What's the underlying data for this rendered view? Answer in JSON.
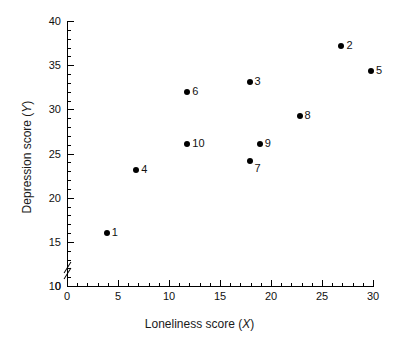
{
  "chart_data": {
    "type": "scatter",
    "title": "",
    "xlabel": "Loneliness score (X)",
    "ylabel": "Depression score (Y)",
    "xlabel_text": "Loneliness score (",
    "xlabel_var": "X",
    "xlabel_tail": ")",
    "ylabel_text": "Depression score (",
    "ylabel_var": "Y",
    "ylabel_tail": ")",
    "xlim": [
      0,
      30
    ],
    "ylim": [
      10,
      40
    ],
    "y_axis_break": true,
    "y_break_label": "0",
    "grid": false,
    "legend": "none",
    "x_major_ticks": [
      0,
      5,
      10,
      15,
      20,
      25,
      30
    ],
    "x_tick_labels": [
      "0",
      "5",
      "10",
      "15",
      "20",
      "25",
      "30"
    ],
    "x_minor_step": 1,
    "y_major_ticks": [
      10,
      15,
      20,
      25,
      30,
      35,
      40
    ],
    "y_tick_labels": [
      "10",
      "15",
      "20",
      "25",
      "30",
      "35",
      "40"
    ],
    "y_minor_step": 1,
    "point_labels": [
      "1",
      "2",
      "3",
      "4",
      "5",
      "6",
      "7",
      "8",
      "9",
      "10"
    ],
    "x": [
      3.9,
      26.9,
      17.9,
      6.8,
      29.8,
      11.8,
      17.9,
      22.8,
      18.9,
      11.8
    ],
    "y": [
      16.0,
      37.2,
      33.1,
      23.1,
      34.3,
      32.0,
      24.2,
      29.2,
      26.1,
      26.1
    ],
    "points": [
      {
        "label": "1",
        "x": 3.9,
        "y": 16.0,
        "label_pos": "right"
      },
      {
        "label": "2",
        "x": 26.9,
        "y": 37.2,
        "label_pos": "right"
      },
      {
        "label": "3",
        "x": 17.9,
        "y": 33.1,
        "label_pos": "right"
      },
      {
        "label": "4",
        "x": 6.8,
        "y": 23.1,
        "label_pos": "right"
      },
      {
        "label": "5",
        "x": 29.8,
        "y": 34.3,
        "label_pos": "right"
      },
      {
        "label": "6",
        "x": 11.8,
        "y": 32.0,
        "label_pos": "right"
      },
      {
        "label": "7",
        "x": 17.9,
        "y": 24.2,
        "label_pos": "below-right"
      },
      {
        "label": "8",
        "x": 22.8,
        "y": 29.2,
        "label_pos": "right"
      },
      {
        "label": "9",
        "x": 18.9,
        "y": 26.1,
        "label_pos": "right"
      },
      {
        "label": "10",
        "x": 11.8,
        "y": 26.1,
        "label_pos": "right"
      }
    ],
    "marker": "filled-circle",
    "marker_color": "#000000",
    "axis_color": "#000000",
    "background": "#ffffff"
  }
}
